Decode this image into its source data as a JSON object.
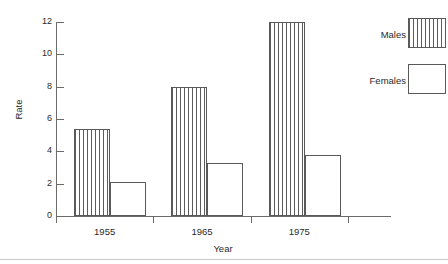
{
  "chart_data": {
    "type": "bar",
    "title": "",
    "subtitle": "",
    "xlabel": "Year",
    "ylabel": "Rate",
    "categories": [
      "1955",
      "1965",
      "1975"
    ],
    "series": [
      {
        "name": "Males",
        "values": [
          5.4,
          8.0,
          12.0
        ],
        "pattern": "vertical-hatch",
        "color": "#5c5c5c"
      },
      {
        "name": "Females",
        "values": [
          2.1,
          3.3,
          3.8
        ],
        "pattern": "empty",
        "color": "#ffffff"
      }
    ],
    "ylim": [
      0,
      12
    ],
    "ytick_values": [
      0,
      2,
      4,
      6,
      8,
      10,
      12
    ],
    "ytick_labels": [
      "0",
      "2",
      "4",
      "6",
      "8",
      "10",
      "12"
    ],
    "xtick_labels": [
      "1955",
      "1965",
      "1975"
    ],
    "grid": false,
    "legend_position": "top-right",
    "legend_entries": [
      "Males",
      "Females"
    ],
    "annotations": []
  },
  "axes": {
    "y_title": "Rate",
    "x_title": "Year"
  },
  "legend": {
    "males_label": "Males",
    "females_label": "Females"
  }
}
